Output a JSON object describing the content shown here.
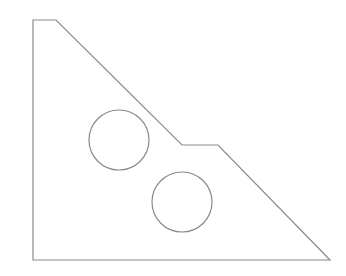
{
  "diagram": {
    "type": "line-drawing",
    "stroke_color": "#8a8a8a",
    "background": "#ffffff",
    "outline": {
      "description": "triangular plate with stepped hypotenuse",
      "points": [
        [
          33,
          20
        ],
        [
          56,
          20
        ],
        [
          182,
          145
        ],
        [
          218,
          145
        ],
        [
          330,
          260
        ],
        [
          33,
          260
        ]
      ]
    },
    "holes": [
      {
        "cx": 119,
        "cy": 140,
        "r": 30
      },
      {
        "cx": 182,
        "cy": 202,
        "r": 30
      }
    ]
  }
}
